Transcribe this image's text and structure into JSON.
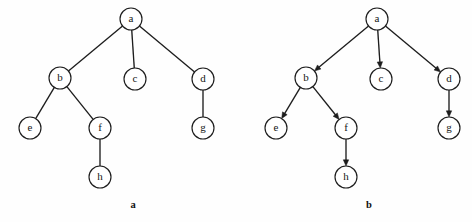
{
  "figure": {
    "background_color": "#fefefe",
    "stroke_color": "#1d1d1d",
    "node_fill": "#ffffff",
    "node_radius": 11,
    "width": 472,
    "height": 222
  },
  "panels": [
    {
      "id": "panel-a",
      "caption": "a",
      "caption_x": 133,
      "caption_y": 206,
      "directed": false,
      "nodes": [
        {
          "id": "a",
          "label": "a",
          "x": 131,
          "y": 19
        },
        {
          "id": "b",
          "label": "b",
          "x": 60,
          "y": 78
        },
        {
          "id": "c",
          "label": "c",
          "x": 135,
          "y": 79
        },
        {
          "id": "d",
          "label": "d",
          "x": 203,
          "y": 79
        },
        {
          "id": "e",
          "label": "e",
          "x": 30,
          "y": 128
        },
        {
          "id": "f",
          "label": "f",
          "x": 100,
          "y": 128
        },
        {
          "id": "g",
          "label": "g",
          "x": 203,
          "y": 128
        },
        {
          "id": "h",
          "label": "h",
          "x": 100,
          "y": 177
        }
      ],
      "edges": [
        {
          "from": "a",
          "to": "b"
        },
        {
          "from": "a",
          "to": "c"
        },
        {
          "from": "a",
          "to": "d"
        },
        {
          "from": "b",
          "to": "e"
        },
        {
          "from": "b",
          "to": "f"
        },
        {
          "from": "d",
          "to": "g"
        },
        {
          "from": "f",
          "to": "h"
        }
      ]
    },
    {
      "id": "panel-b",
      "caption": "b",
      "caption_x": 369,
      "caption_y": 206,
      "directed": true,
      "nodes": [
        {
          "id": "a",
          "label": "a",
          "x": 377,
          "y": 19
        },
        {
          "id": "b",
          "label": "b",
          "x": 306,
          "y": 78
        },
        {
          "id": "c",
          "label": "c",
          "x": 381,
          "y": 79
        },
        {
          "id": "d",
          "label": "d",
          "x": 449,
          "y": 79
        },
        {
          "id": "e",
          "label": "e",
          "x": 276,
          "y": 128
        },
        {
          "id": "f",
          "label": "f",
          "x": 346,
          "y": 128
        },
        {
          "id": "g",
          "label": "g",
          "x": 449,
          "y": 128
        },
        {
          "id": "h",
          "label": "h",
          "x": 346,
          "y": 177
        }
      ],
      "edges": [
        {
          "from": "a",
          "to": "b"
        },
        {
          "from": "a",
          "to": "c"
        },
        {
          "from": "a",
          "to": "d"
        },
        {
          "from": "b",
          "to": "e"
        },
        {
          "from": "b",
          "to": "f"
        },
        {
          "from": "d",
          "to": "g"
        },
        {
          "from": "f",
          "to": "h"
        }
      ]
    }
  ]
}
